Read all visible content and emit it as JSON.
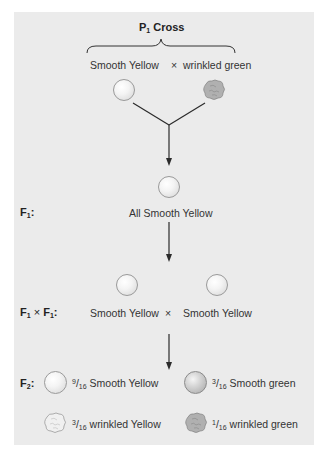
{
  "title": {
    "prefix": "P",
    "sub": "1",
    "suffix": " Cross"
  },
  "p1": {
    "left_label": "Smooth Yellow",
    "cross_symbol": "×",
    "right_label": "wrinkled green"
  },
  "f1": {
    "gen_prefix": "F",
    "gen_sub": "1",
    "gen_suffix": ":",
    "label": "All Smooth Yellow"
  },
  "f1xf1": {
    "gen_a": "F",
    "gen_a_sub": "1",
    "times": " × ",
    "gen_b": "F",
    "gen_b_sub": "1",
    "gen_suffix": ":",
    "left_label": "Smooth Yellow",
    "cross_symbol": "×",
    "right_label": "Smooth Yellow"
  },
  "f2": {
    "gen_prefix": "F",
    "gen_sub": "2",
    "gen_suffix": ":",
    "outcomes": [
      {
        "num": "9",
        "den": "16",
        "label": " Smooth Yellow",
        "phenotype": "smooth-yellow"
      },
      {
        "num": "3",
        "den": "16",
        "label": " Smooth green",
        "phenotype": "smooth-green"
      },
      {
        "num": "3",
        "den": "16",
        "label": " wrinkled Yellow",
        "phenotype": "wrinkled-yellow"
      },
      {
        "num": "1",
        "den": "16",
        "label": " wrinkled green",
        "phenotype": "wrinkled-green"
      }
    ]
  },
  "colors": {
    "panel_bg": "#ebebeb",
    "line": "#2b2b2b",
    "text": "#333333"
  }
}
